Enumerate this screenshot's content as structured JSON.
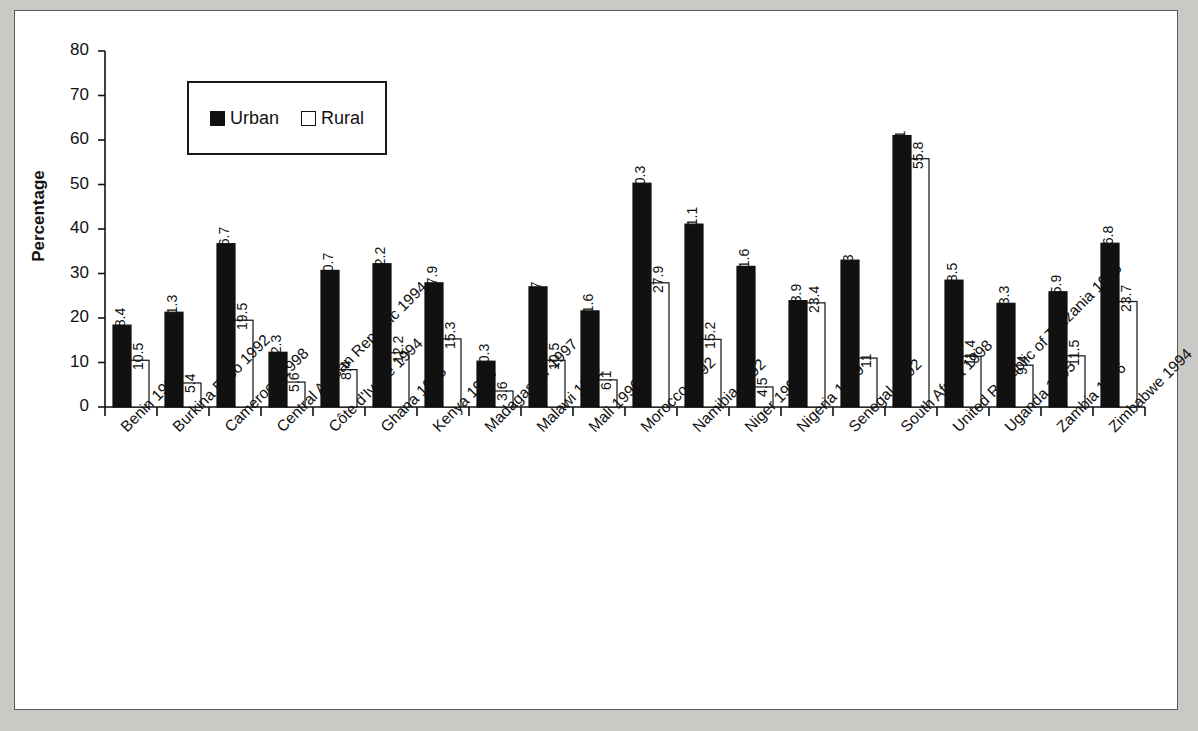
{
  "chart_data": {
    "type": "bar",
    "title": "",
    "xlabel": "",
    "ylabel": "Percentage",
    "ylim": [
      0,
      80
    ],
    "ytick_step": 10,
    "yticks": [
      0,
      10,
      20,
      30,
      40,
      50,
      60,
      70,
      80
    ],
    "grid": false,
    "legend_position": "upper-left-inside",
    "categories": [
      "Benin 1996",
      "Burkina Faso 1992",
      "Cameroon 1998",
      "Central African Republic 1994",
      "Côte d'Ivoire 1994",
      "Ghana 1998",
      "Kenya 1998",
      "Madagascar 1997",
      "Malawi 1992",
      "Mali 1996",
      "Morocco 1992",
      "Namibia 1992",
      "Niger 1998",
      "Nigeria 1999",
      "Senegal 1992",
      "South Africa 1998",
      "United Republic of Tanzania 1996",
      "Uganda 1995",
      "Zambia 1996",
      "Zimbabwe 1994"
    ],
    "series": [
      {
        "name": "Urban",
        "color": "#111111",
        "values": [
          18.4,
          21.3,
          36.7,
          12.3,
          30.7,
          32.2,
          27.9,
          10.3,
          27,
          21.6,
          50.3,
          41.1,
          31.6,
          23.9,
          33,
          61,
          28.5,
          23.3,
          25.9,
          36.8
        ],
        "labels": [
          "18.4",
          "21.3",
          "36.7",
          "12.3",
          "30.7",
          "32.2",
          "27.9",
          "10.3",
          "27",
          "21.6",
          "50.3",
          "41.1",
          "31.6",
          "23.9",
          "33",
          "61",
          "28.5",
          "23.3",
          "25.9",
          "36.8"
        ]
      },
      {
        "name": "Rural",
        "color": "#ffffff",
        "values": [
          10.5,
          5.4,
          19.5,
          5.6,
          8.4,
          12.2,
          15.3,
          3.6,
          10.5,
          6.1,
          27.9,
          15.2,
          4.5,
          23.4,
          11,
          55.8,
          11.4,
          9.4,
          11.5,
          23.7
        ],
        "labels": [
          "10.5",
          "5.4",
          "19.5",
          "5.6",
          "8.4",
          "12.2",
          "15.3",
          "3.6",
          "10.5",
          "6.1",
          "27.9",
          "15.2",
          "4.5",
          "23.4",
          "11",
          "55.8",
          "11.4",
          "9.4",
          "11.5",
          "23.7"
        ]
      }
    ]
  },
  "legend": {
    "urban_label": "Urban",
    "rural_label": "Rural"
  },
  "axis": {
    "y_title": "Percentage"
  }
}
